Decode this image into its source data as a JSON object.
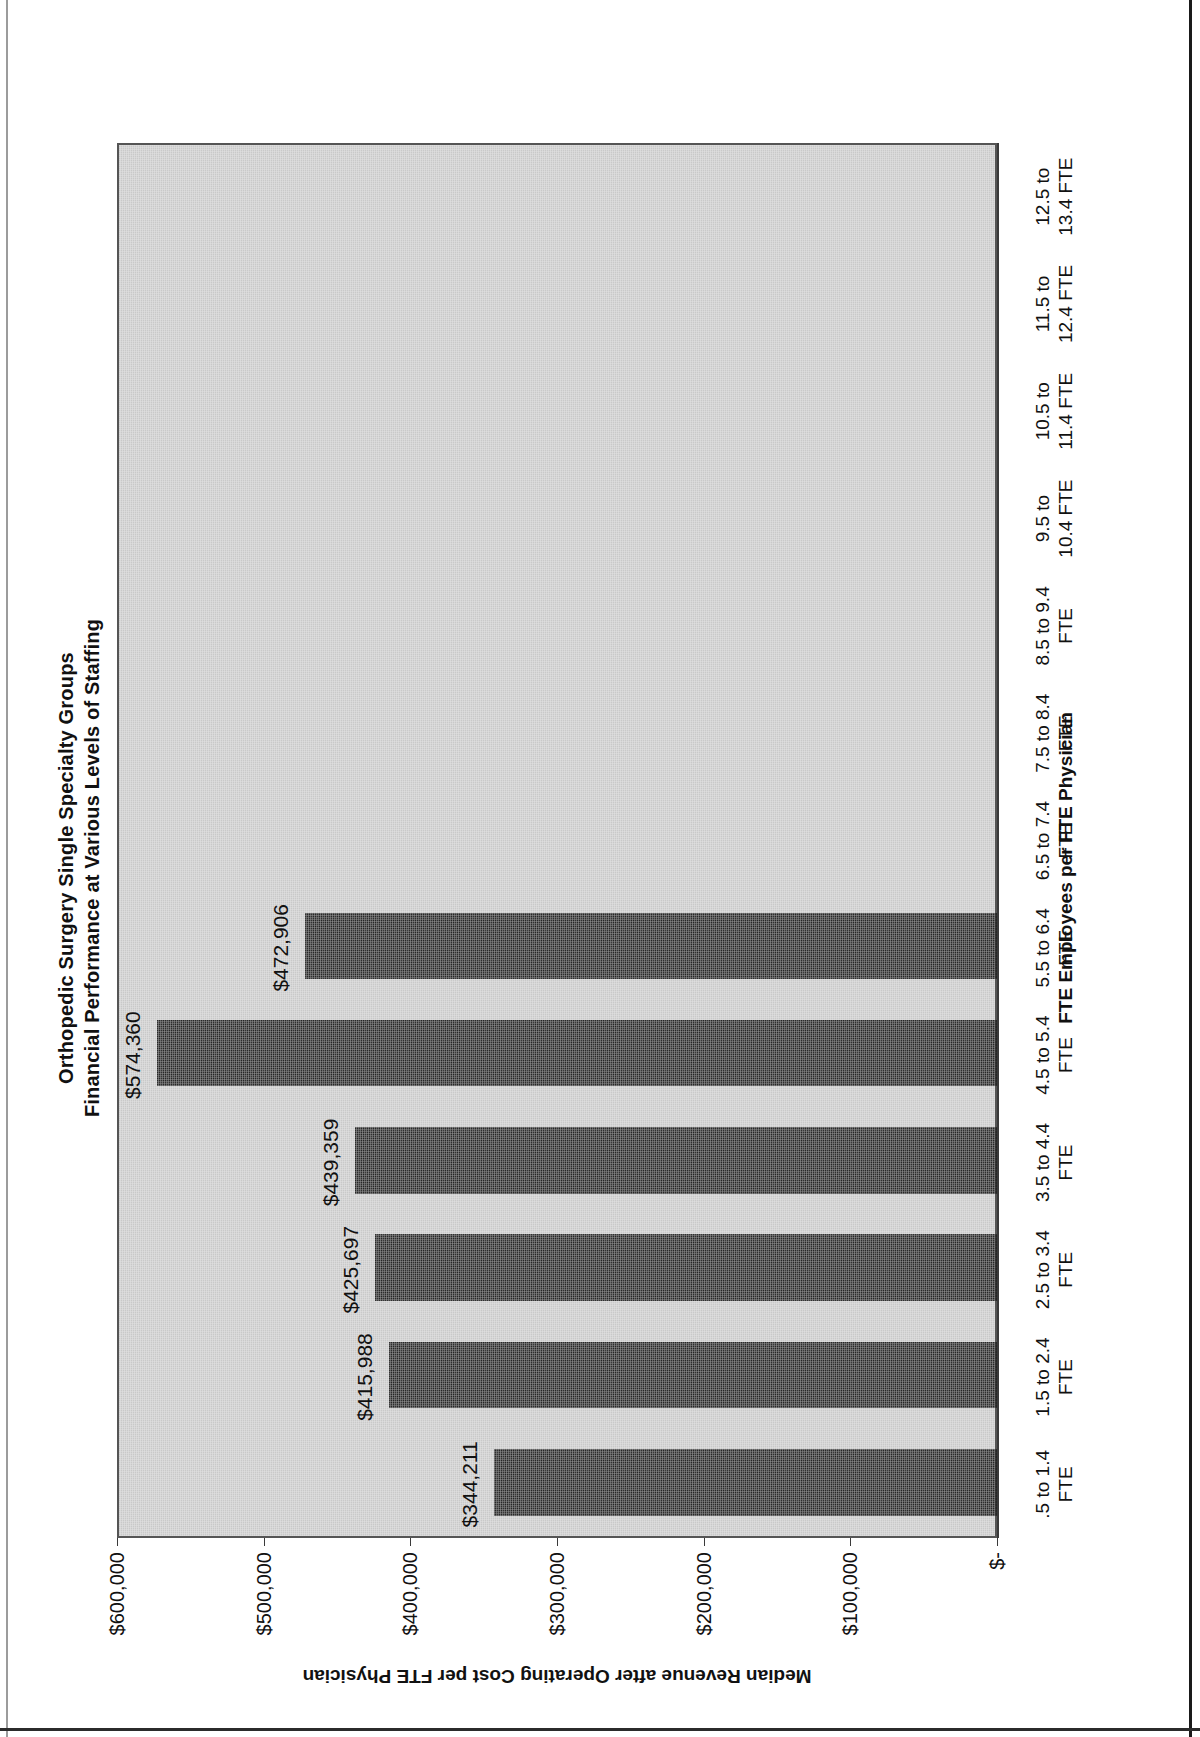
{
  "chart_data": {
    "type": "bar",
    "orientation": "vertical",
    "title": "Orthopedic Surgery Single Specialty Groups",
    "subtitle": "Financial Performance at Various Levels of Staffing",
    "xlabel": "FTE Employees per FTE Physician",
    "ylabel": "Median Revenue after Operating Cost per FTE Physician",
    "categories": [
      ".5 to 1.4 FTE",
      "1.5 to 2.4 FTE",
      "2.5 to 3.4 FTE",
      "3.5 to 4.4 FTE",
      "4.5 to 5.4 FTE",
      "5.5 to 6.4 FTE",
      "6.5 to 7.4 FTE",
      "7.5 to 8.4 FTE",
      "8.5 to 9.4 FTE",
      "9.5 to 10.4 FTE",
      "10.5 to 11.4 FTE",
      "11.5 to 12.4 FTE",
      "12.5 to 13.4 FTE"
    ],
    "category_lines": [
      [
        ".5 to 1.4",
        "FTE"
      ],
      [
        "1.5 to 2.4",
        "FTE"
      ],
      [
        "2.5 to 3.4",
        "FTE"
      ],
      [
        "3.5 to 4.4",
        "FTE"
      ],
      [
        "4.5 to 5.4",
        "FTE"
      ],
      [
        "5.5 to 6.4",
        "FTE"
      ],
      [
        "6.5 to 7.4",
        "FTE"
      ],
      [
        "7.5 to 8.4",
        "FTE"
      ],
      [
        "8.5 to 9.4",
        "FTE"
      ],
      [
        "9.5 to",
        "10.4 FTE"
      ],
      [
        "10.5 to",
        "11.4 FTE"
      ],
      [
        "11.5 to",
        "12.4 FTE"
      ],
      [
        "12.5 to",
        "13.4 FTE"
      ]
    ],
    "values": [
      344211,
      415988,
      425697,
      439359,
      574360,
      472906,
      null,
      null,
      null,
      null,
      null,
      null,
      null
    ],
    "data_labels": [
      "$344,211",
      "$415,988",
      "$425,697",
      "$439,359",
      "$574,360",
      "$472,906",
      "",
      "",
      "",
      "",
      "",
      "",
      ""
    ],
    "ylim": [
      0,
      600000
    ],
    "ytick_values": [
      0,
      100000,
      200000,
      300000,
      400000,
      500000,
      600000
    ],
    "ytick_labels": [
      "$-",
      "$100,000",
      "$200,000",
      "$300,000",
      "$400,000",
      "$500,000",
      "$600,000"
    ],
    "grid": false,
    "legend": null,
    "bar_color": "#262626",
    "plot_background": "#c9c9c9"
  },
  "page": {
    "rotation_note": "landscape chart scanned rotated 90 degrees counter-clockwise"
  }
}
